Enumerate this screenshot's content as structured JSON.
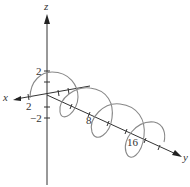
{
  "diagram": {
    "type": "3d-helix-plot",
    "axes": {
      "z": {
        "label": "z"
      },
      "x": {
        "label": "x"
      },
      "y": {
        "label": "y"
      }
    },
    "ticks": {
      "z_pos": "2",
      "x_pos": "2",
      "z_neg": "−2",
      "y_8": "8",
      "y_16": "16"
    },
    "colors": {
      "axis": "#333333",
      "curve": "#888888",
      "background": "#ffffff"
    }
  }
}
